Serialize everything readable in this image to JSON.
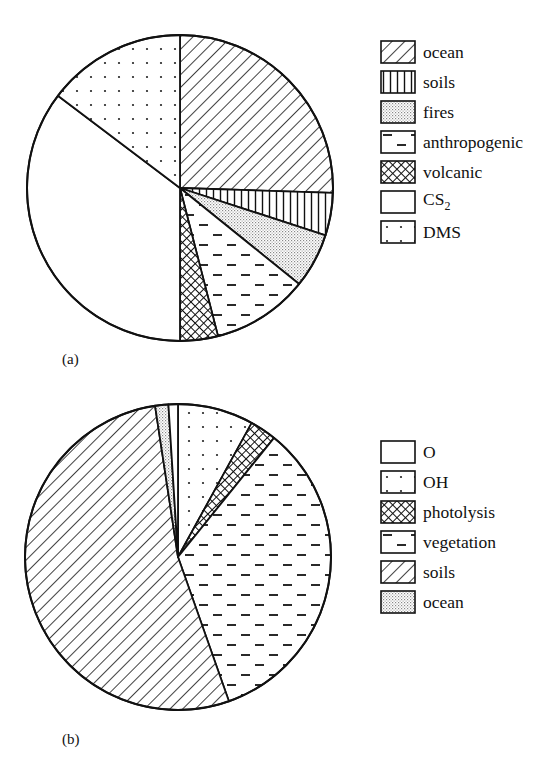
{
  "chart_data": [
    {
      "type": "pie",
      "panel_label": "(a)",
      "title": "",
      "start_angle_deg": 0,
      "direction": "clockwise",
      "legend_position": "right",
      "slices": [
        {
          "label": "ocean",
          "value": 25.5,
          "pattern": "diag"
        },
        {
          "label": "soils",
          "value": 4.5,
          "pattern": "vert"
        },
        {
          "label": "fires",
          "value": 5.8,
          "pattern": "stipple"
        },
        {
          "label": "anthropogenic",
          "value": 10.2,
          "pattern": "dash"
        },
        {
          "label": "volcanic",
          "value": 4.0,
          "pattern": "cross"
        },
        {
          "label": "CS2",
          "value": 35.3,
          "pattern": "none"
        },
        {
          "label": "DMS",
          "value": 14.7,
          "pattern": "dots"
        }
      ],
      "legend": [
        {
          "label": "ocean",
          "pattern": "diag"
        },
        {
          "label": "soils",
          "pattern": "vert"
        },
        {
          "label": "fires",
          "pattern": "stipple"
        },
        {
          "label": "anthropogenic",
          "pattern": "dash"
        },
        {
          "label": "volcanic",
          "pattern": "cross"
        },
        {
          "label": "CS",
          "sub": "2",
          "pattern": "none"
        },
        {
          "label": "DMS",
          "pattern": "dots"
        }
      ]
    },
    {
      "type": "pie",
      "panel_label": "(b)",
      "title": "",
      "start_angle_deg": 0,
      "direction": "clockwise",
      "legend_position": "right",
      "slices": [
        {
          "label": "OH",
          "value": 8.0,
          "pattern": "dots"
        },
        {
          "label": "photolysis",
          "value": 2.8,
          "pattern": "cross"
        },
        {
          "label": "vegetation",
          "value": 33.8,
          "pattern": "dash"
        },
        {
          "label": "soils",
          "value": 53.0,
          "pattern": "diag"
        },
        {
          "label": "ocean",
          "value": 1.4,
          "pattern": "stipple"
        },
        {
          "label": "O",
          "value": 1.0,
          "pattern": "none"
        }
      ],
      "legend": [
        {
          "label": "O",
          "pattern": "none"
        },
        {
          "label": "OH",
          "pattern": "dots"
        },
        {
          "label": "photolysis",
          "pattern": "cross"
        },
        {
          "label": "vegetation",
          "pattern": "dash"
        },
        {
          "label": "soils",
          "pattern": "diag"
        },
        {
          "label": "ocean",
          "pattern": "stipple"
        }
      ]
    }
  ],
  "panels": {
    "a": {
      "label": "(a)"
    },
    "b": {
      "label": "(b)"
    }
  },
  "colors": {
    "ink": "#111111",
    "background": "#ffffff"
  }
}
